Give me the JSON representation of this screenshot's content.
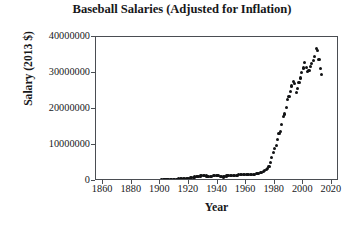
{
  "chart_data": {
    "type": "scatter",
    "title": "Baseball Salaries (Adjusted for Inflation)",
    "xlabel": "Year",
    "ylabel": "Salary (2013 $)",
    "xlim": [
      1855,
      2025
    ],
    "ylim": [
      0,
      40000000
    ],
    "grid": false,
    "legend": null,
    "xticks": [
      "1860",
      "1880",
      "1900",
      "1920",
      "1940",
      "1960",
      "1980",
      "2000",
      "2020"
    ],
    "xtick_values": [
      1860,
      1880,
      1900,
      1920,
      1940,
      1960,
      1980,
      2000,
      2020
    ],
    "yticks": [
      "0",
      "10000000",
      "20000000",
      "30000000",
      "40000000"
    ],
    "ytick_values": [
      0,
      10000000,
      20000000,
      30000000,
      40000000
    ],
    "marker": "filled-circle",
    "marker_color": "#111214",
    "x": [
      1874,
      1875,
      1876,
      1877,
      1878,
      1879,
      1880,
      1881,
      1882,
      1883,
      1884,
      1885,
      1886,
      1887,
      1888,
      1889,
      1890,
      1891,
      1892,
      1893,
      1894,
      1895,
      1896,
      1897,
      1898,
      1899,
      1900,
      1901,
      1902,
      1903,
      1904,
      1905,
      1906,
      1907,
      1908,
      1909,
      1910,
      1911,
      1912,
      1913,
      1914,
      1915,
      1916,
      1917,
      1918,
      1919,
      1920,
      1921,
      1922,
      1923,
      1924,
      1925,
      1926,
      1927,
      1928,
      1929,
      1930,
      1931,
      1932,
      1933,
      1934,
      1935,
      1936,
      1937,
      1938,
      1939,
      1940,
      1941,
      1942,
      1943,
      1944,
      1945,
      1946,
      1947,
      1948,
      1949,
      1950,
      1951,
      1952,
      1953,
      1954,
      1955,
      1956,
      1957,
      1958,
      1959,
      1960,
      1961,
      1962,
      1963,
      1964,
      1965,
      1966,
      1967,
      1968,
      1969,
      1970,
      1971,
      1972,
      1973,
      1974,
      1975,
      1976,
      1977,
      1978,
      1979,
      1980,
      1981,
      1982,
      1983,
      1984,
      1985,
      1986,
      1987,
      1988,
      1989,
      1990,
      1991,
      1992,
      1993,
      1994,
      1995,
      1996,
      1997,
      1998,
      1999,
      2000,
      2001,
      2002,
      2003,
      2004,
      2005,
      2006,
      2007,
      2008,
      2009,
      2010,
      2011,
      2012,
      2013
    ],
    "y": [
      120000,
      125000,
      130000,
      128000,
      135000,
      140000,
      150000,
      155000,
      160000,
      165000,
      175000,
      185000,
      190000,
      200000,
      205000,
      215000,
      225000,
      230000,
      215000,
      205000,
      210000,
      215000,
      220000,
      225000,
      230000,
      235000,
      250000,
      270000,
      290000,
      310000,
      330000,
      350000,
      370000,
      385000,
      400000,
      420000,
      450000,
      480000,
      520000,
      560000,
      600000,
      620000,
      640000,
      620000,
      560000,
      640000,
      780000,
      900000,
      980000,
      1050000,
      1120000,
      1180000,
      1240000,
      1320000,
      1400000,
      1450000,
      1560000,
      1480000,
      1380000,
      1180000,
      1220000,
      1280000,
      1340000,
      1420000,
      1460000,
      1500000,
      1460000,
      1420000,
      1340000,
      1180000,
      1120000,
      1180000,
      1380000,
      1520000,
      1580000,
      1620000,
      1640000,
      1600000,
      1560000,
      1600000,
      1640000,
      1680000,
      1720000,
      1760000,
      1800000,
      1840000,
      1860000,
      1880000,
      1840000,
      1800000,
      1820000,
      1860000,
      1920000,
      1980000,
      2020000,
      2180000,
      2380000,
      2480000,
      2620000,
      2880000,
      3120000,
      3380000,
      3920000,
      5200000,
      6600000,
      7900000,
      9100000,
      9800000,
      11600000,
      13200000,
      13800000,
      15600000,
      17800000,
      18600000,
      20400000,
      22600000,
      23400000,
      24800000,
      26400000,
      27600000,
      27200000,
      24600000,
      25800000,
      27400000,
      28600000,
      30200000,
      31400000,
      32800000,
      31600000,
      30400000,
      30800000,
      31800000,
      32600000,
      33400000,
      34600000,
      36800000,
      36200000,
      33800000,
      31200000,
      29600000
    ]
  }
}
